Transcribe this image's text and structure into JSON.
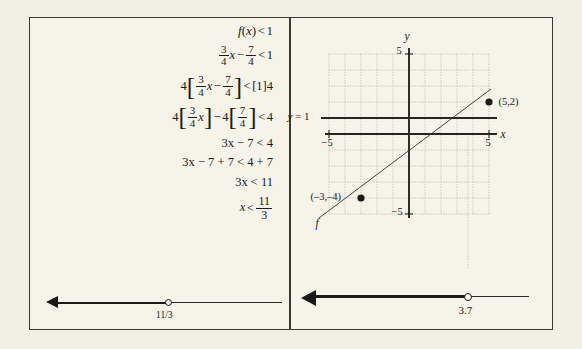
{
  "figure": {
    "background_color": "#f6f3e9",
    "border_color": "#3a3a32",
    "ink_color": "#1a1a18"
  },
  "left_panel": {
    "title": "algebraic-solution-steps",
    "equations": [
      {
        "id": "step-1",
        "text": "f(x) < 1"
      },
      {
        "id": "step-2",
        "text": "3/4 x - 7/4 < 1"
      },
      {
        "id": "step-3",
        "text": "4[3/4 x - 7/4] < [1]4"
      },
      {
        "id": "step-4",
        "text": "4[3/4 x] - 4[7/4] < 4"
      },
      {
        "id": "step-5",
        "text": "3x - 7 < 4"
      },
      {
        "id": "step-6",
        "text": "3x - 7 + 7 < 4 + 7"
      },
      {
        "id": "step-7",
        "text": "3x < 11"
      },
      {
        "id": "step-8",
        "text": "x < 11/3"
      }
    ],
    "tokens": {
      "f": "f",
      "lparen": "(",
      "rparen": ")",
      "x": "x",
      "lt": "<",
      "one": "1",
      "three": "3",
      "four": "4",
      "seven": "7",
      "minus": "−",
      "plus": "+",
      "lbracket": "[",
      "rbracket": "]",
      "step5": "3x − 7 < 4",
      "step6": "3x − 7 + 7 < 4 + 7",
      "step7": "3x < 11"
    },
    "number_line": {
      "name": "solution-number-line-fraction",
      "direction": "left",
      "endpoint_value": "11/3",
      "endpoint_type": "open",
      "label": "11/3"
    }
  },
  "right_panel": {
    "graph": {
      "name": "coordinate-plane",
      "x_axis_label": "x",
      "y_axis_label": "y",
      "x_min": -5,
      "x_max": 5,
      "y_min": -5,
      "y_max": 5,
      "x_tick_labels": [
        "-5",
        "5"
      ],
      "y_tick_labels": [
        "5",
        "-5"
      ],
      "y_min_label": "−5",
      "y_max_label": "5",
      "x_min_label": "−5",
      "x_max_label": "5",
      "grid": true,
      "grid_step": 1,
      "function_label": "f",
      "horizontal_line": {
        "name": "y-equals-one-line",
        "label": "y = 1",
        "label_var": "y",
        "label_rest": "= 1",
        "value": 1
      },
      "points": [
        {
          "name": "point-5-2",
          "label": "(5,2)",
          "x": 5,
          "y": 2
        },
        {
          "name": "point-neg3-neg4",
          "label": "(–3,–4)",
          "x": -3,
          "y": -4
        }
      ],
      "line_through": {
        "from": [
          -3,
          -4
        ],
        "to": [
          5,
          2
        ]
      },
      "intersection_x": 3.7
    },
    "number_line": {
      "name": "solution-number-line-decimal",
      "direction": "left",
      "endpoint_value": 3.7,
      "endpoint_type": "open",
      "label": "3.7"
    }
  }
}
